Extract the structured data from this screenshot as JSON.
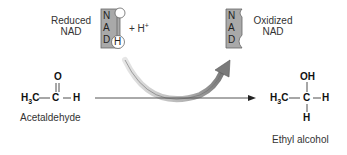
{
  "diagram": {
    "reduced_nad": {
      "label_line1": "Reduced",
      "label_line2": "NAD",
      "letters": [
        "N",
        "A",
        "D"
      ],
      "h_circle": "H",
      "plus_h": "+ H",
      "h_charge": "+"
    },
    "oxidized_nad": {
      "label_line1": "Oxidized",
      "label_line2": "NAD",
      "letters": [
        "N",
        "A",
        "D"
      ]
    },
    "reactant": {
      "name": "Acetaldehyde",
      "top_atom": "O",
      "left_group": "H3C",
      "center": "C",
      "right_atom": "H"
    },
    "product": {
      "name": "Ethyl alcohol",
      "top_group": "OH",
      "left_group": "H3C",
      "center": "C",
      "right_atom": "H",
      "bottom_atom": "H"
    },
    "colors": {
      "nad_fill": "#a9a9a9",
      "arrow_gray": "#8a8a8a",
      "line": "#555555"
    }
  }
}
